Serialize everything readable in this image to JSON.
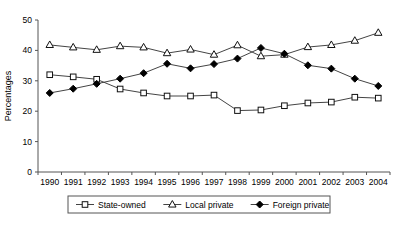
{
  "chart_data": {
    "type": "line",
    "title": "",
    "xlabel": "",
    "ylabel": "Percentages",
    "categories": [
      "1990",
      "1991",
      "1992",
      "1993",
      "1994",
      "1995",
      "1996",
      "1997",
      "1998",
      "1999",
      "2000",
      "2001",
      "2002",
      "2003",
      "2004"
    ],
    "ylim": [
      0,
      50
    ],
    "yticks": [
      0,
      10,
      20,
      30,
      40,
      50
    ],
    "grid": false,
    "legend_position": "bottom",
    "series": [
      {
        "name": "State-owned",
        "marker": "open-square",
        "values": [
          32.0,
          31.3,
          30.5,
          27.3,
          26.0,
          25.0,
          25.0,
          25.3,
          20.2,
          20.4,
          21.8,
          22.7,
          23.0,
          24.6,
          24.3
        ]
      },
      {
        "name": "Local private",
        "marker": "open-triangle",
        "values": [
          41.8,
          41.0,
          40.2,
          41.4,
          41.0,
          39.1,
          40.3,
          38.6,
          41.7,
          38.1,
          38.6,
          41.1,
          41.8,
          43.2,
          45.8
        ]
      },
      {
        "name": "Foreign private",
        "marker": "filled-diamond",
        "values": [
          26.0,
          27.4,
          29.0,
          30.7,
          32.5,
          35.6,
          34.1,
          35.5,
          37.3,
          40.8,
          38.9,
          35.1,
          34.0,
          30.7,
          28.3
        ]
      }
    ]
  },
  "axis": {
    "y_label": "Percentages",
    "y_tick_labels": [
      "50",
      "40",
      "30",
      "20",
      "10",
      "0"
    ],
    "x_tick_labels": [
      "1990",
      "1991",
      "1992",
      "1993",
      "1994",
      "1995",
      "1996",
      "1997",
      "1998",
      "1999",
      "2000",
      "2001",
      "2002",
      "2003",
      "2004"
    ]
  },
  "legend": {
    "entries": [
      {
        "label": "State-owned",
        "marker": "open-square"
      },
      {
        "label": "Local private",
        "marker": "open-triangle"
      },
      {
        "label": "Foreign private",
        "marker": "filled-diamond"
      }
    ]
  },
  "colors": {
    "line": "#444444",
    "marker_fill_open": "#ffffff",
    "marker_fill_solid": "#000000",
    "axis": "#555555",
    "background": "#ffffff"
  }
}
